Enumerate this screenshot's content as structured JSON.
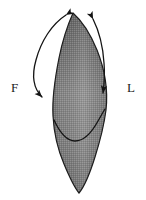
{
  "figure": {
    "type": "anatomical-diagram",
    "background_color": "#ffffff",
    "labels": [
      {
        "id": "F",
        "text": "F",
        "position": "left",
        "x": 11,
        "y": 81
      },
      {
        "id": "L",
        "text": "L",
        "position": "right",
        "x": 127,
        "y": 81
      }
    ],
    "shape": {
      "name": "spindle-body",
      "description": "elongated leaf-shaped shaded body with pointed apex at top and tapering rounded tip at bottom",
      "fill_top_color": "#6e6e6e",
      "fill_mid_color": "#8a8a8a",
      "fill_bottom_color": "#7a7a7a",
      "outline_color": "#1d1d1d",
      "apex_x": 73,
      "apex_y": 13,
      "base_x": 79,
      "base_y": 193,
      "max_width_y": 118
    },
    "internal_curve": {
      "name": "wavy-dividing-line",
      "stroke_color": "#141414",
      "stroke_width": 1.3,
      "description": "S-shaped wavy line crossing the lower third of the body"
    },
    "arrows": [
      {
        "id": "left-arc",
        "name": "left-curved-double-arrow",
        "side": "left",
        "label": "F",
        "head_top": {
          "x": 66,
          "y": 14,
          "direction": "up-right"
        },
        "head_bottom": {
          "x": 44,
          "y": 99,
          "direction": "down-right"
        },
        "stroke_color": "#141414",
        "stroke_width": 1.3
      },
      {
        "id": "right-arc",
        "name": "right-curved-double-arrow",
        "side": "right",
        "label": "L",
        "head_top": {
          "x": 92,
          "y": 18,
          "direction": "up-left"
        },
        "head_bottom": {
          "x": 104,
          "y": 95,
          "direction": "down"
        },
        "stroke_color": "#141414",
        "stroke_width": 1.3
      }
    ]
  }
}
